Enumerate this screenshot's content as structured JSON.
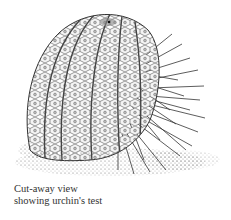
{
  "figure": {
    "caption": {
      "line1": "Cut-away view",
      "line2": "showing urchin's test"
    }
  },
  "colors": {
    "background": "#ffffff",
    "ink": "#222222",
    "caption_text": "#333333"
  }
}
